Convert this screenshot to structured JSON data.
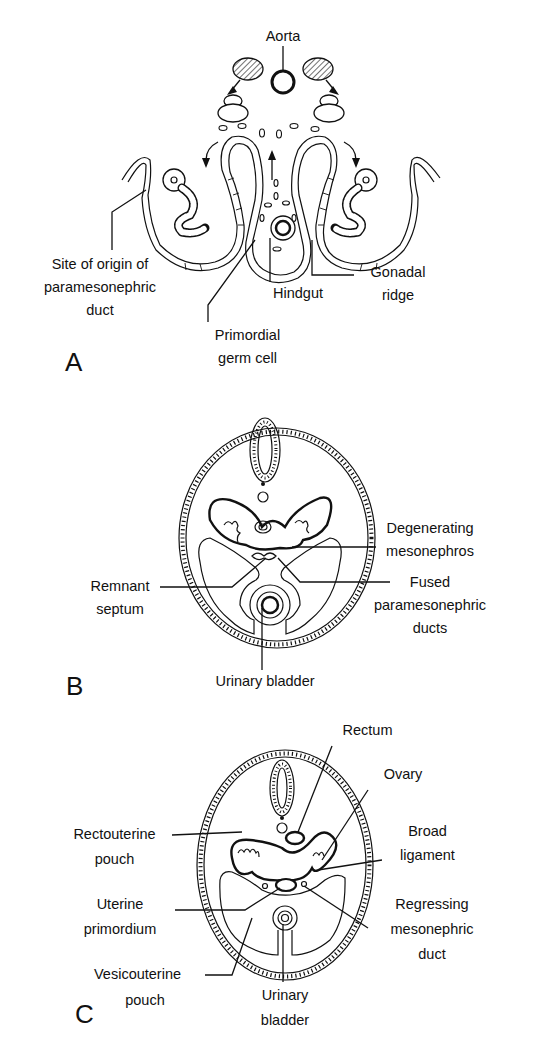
{
  "figure": {
    "panels": [
      {
        "letter": "A",
        "labels": {
          "aorta": "Aorta",
          "site_origin_line1": "Site of origin of",
          "site_origin_line2": "paramesonephric",
          "site_origin_line3": "duct",
          "hindgut": "Hindgut",
          "gonadal_line1": "Gonadal",
          "gonadal_line2": "ridge",
          "pgc_line1": "Primordial",
          "pgc_line2": "germ cell"
        }
      },
      {
        "letter": "B",
        "labels": {
          "degenerating_line1": "Degenerating",
          "degenerating_line2": "mesonephros",
          "remnant_line1": "Remnant",
          "remnant_line2": "septum",
          "fused_line1": "Fused",
          "fused_line2": "paramesonephric",
          "fused_line3": "ducts",
          "urinary_bladder": "Urinary bladder"
        }
      },
      {
        "letter": "C",
        "labels": {
          "rectum": "Rectum",
          "ovary": "Ovary",
          "rectouterine_line1": "Rectouterine",
          "rectouterine_line2": "pouch",
          "broad_line1": "Broad",
          "broad_line2": "ligament",
          "uterine_line1": "Uterine",
          "uterine_line2": "primordium",
          "regressing_line1": "Regressing",
          "regressing_line2": "mesonephric",
          "regressing_line3": "duct",
          "vesicouterine_line1": "Vesicouterine",
          "vesicouterine_line2": "pouch",
          "urinary_line1": "Urinary",
          "urinary_line2": "bladder"
        }
      }
    ]
  }
}
